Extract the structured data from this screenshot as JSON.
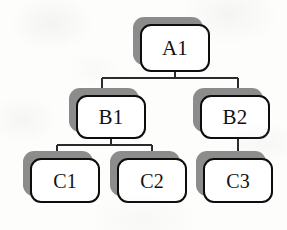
{
  "diagram": {
    "type": "tree",
    "background_color": "#fdfdfc",
    "node_fill_color": "#ffffff",
    "node_border_color": "#0d0d0d",
    "node_shadow_color": "#8c8c8c",
    "edge_color": "#2b2b2b",
    "nodes": [
      {
        "id": "A1",
        "label": "A1",
        "level": 1,
        "x": 133,
        "y": 17,
        "width": 70,
        "height": 48
      },
      {
        "id": "B1",
        "label": "B1",
        "level": 2,
        "x": 69,
        "y": 88,
        "width": 70,
        "height": 44
      },
      {
        "id": "B2",
        "label": "B2",
        "level": 2,
        "x": 193,
        "y": 88,
        "width": 70,
        "height": 44
      },
      {
        "id": "C1",
        "label": "C1",
        "level": 3,
        "x": 23,
        "y": 151,
        "width": 70,
        "height": 45
      },
      {
        "id": "C2",
        "label": "C2",
        "level": 3,
        "x": 110,
        "y": 151,
        "width": 70,
        "height": 45
      },
      {
        "id": "C3",
        "label": "C3",
        "level": 3,
        "x": 196,
        "y": 151,
        "width": 70,
        "height": 45
      }
    ],
    "edges": [
      {
        "from": "A1",
        "to": "B1"
      },
      {
        "from": "A1",
        "to": "B2"
      },
      {
        "from": "B1",
        "to": "C1"
      },
      {
        "from": "B1",
        "to": "C2"
      },
      {
        "from": "B2",
        "to": "C3"
      }
    ]
  }
}
